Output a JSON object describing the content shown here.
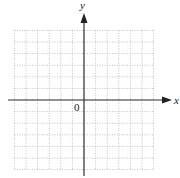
{
  "chart_data": {
    "type": "scatter",
    "title": "",
    "xlabel": "x",
    "ylabel": "y",
    "origin_label": "0",
    "xlim": [
      -6,
      6
    ],
    "ylim": [
      -6,
      6
    ],
    "grid": true,
    "grid_style": "dotted",
    "grid_step": 1,
    "x": [],
    "y": [],
    "series": []
  },
  "diagram": {
    "x_axis_label": "x",
    "y_axis_label": "y",
    "origin_label": "0",
    "colors": {
      "axis": "#333333",
      "grid": "#b0b0b0",
      "background": "#ffffff"
    }
  }
}
